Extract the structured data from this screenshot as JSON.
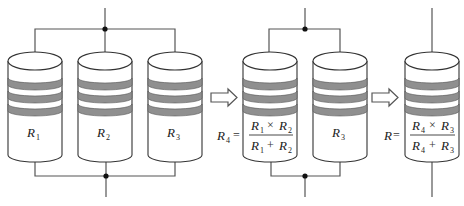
{
  "diagram": {
    "title": "",
    "stage1": {
      "resistors": [
        {
          "symbol": "R",
          "subscript": "1"
        },
        {
          "symbol": "R",
          "subscript": "2"
        },
        {
          "symbol": "R",
          "subscript": "3"
        }
      ],
      "connection": "parallel"
    },
    "arrow1": "right-arrow",
    "stage2": {
      "equivalent": {
        "lhs_symbol": "R",
        "lhs_subscript": "4",
        "equals": "=",
        "numerator": [
          {
            "symbol": "R",
            "subscript": "1"
          },
          {
            "op": "×"
          },
          {
            "symbol": "R",
            "subscript": "2"
          }
        ],
        "denominator": [
          {
            "symbol": "R",
            "subscript": "1"
          },
          {
            "op": "+"
          },
          {
            "symbol": "R",
            "subscript": "2"
          }
        ]
      },
      "other": {
        "symbol": "R",
        "subscript": "3"
      },
      "connection": "parallel"
    },
    "arrow2": "right-arrow",
    "stage3": {
      "equivalent": {
        "lhs_symbol": "R",
        "lhs_subscript": "",
        "equals": "=",
        "numerator": [
          {
            "symbol": "R",
            "subscript": "4"
          },
          {
            "op": "×"
          },
          {
            "symbol": "R",
            "subscript": "3"
          }
        ],
        "denominator": [
          {
            "symbol": "R",
            "subscript": "4"
          },
          {
            "op": "+"
          },
          {
            "symbol": "R",
            "subscript": "3"
          }
        ]
      },
      "connection": "single"
    },
    "colors": {
      "band": "#8f8f8f",
      "wire": "#555555",
      "outline": "#333333",
      "node": "#111111"
    }
  }
}
